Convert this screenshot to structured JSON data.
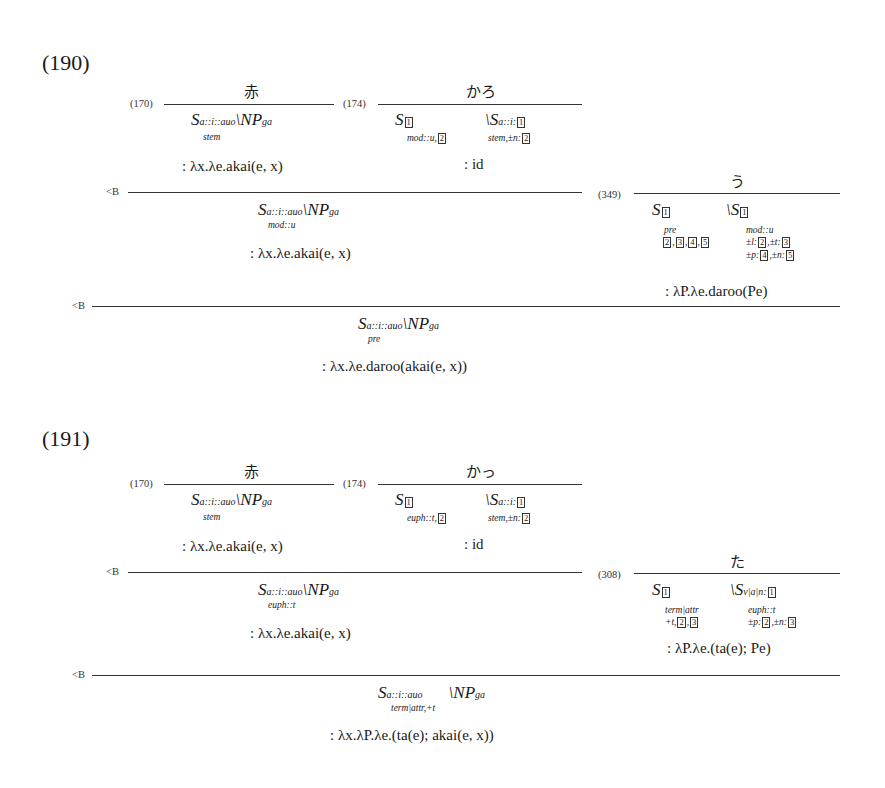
{
  "examples": [
    {
      "number": "(190)",
      "lexical": [
        {
          "rule": "(170)",
          "word": "赤",
          "category": "S_{a::i::auo, stem} \\ NP_{ga}",
          "cat_main": "S",
          "cat_sub": "a::i::auo",
          "cat_feat": "stem",
          "cat_arg": "\\NP",
          "cat_arg_sub": "ga",
          "sem": ": λx.λe.akai(e, x)"
        },
        {
          "rule": "(174)",
          "word": "かろ",
          "cat_left": "S",
          "cat_left_box": "1",
          "cat_left_feat": "mod::u,",
          "cat_left_feat_box": "2",
          "cat_right": "\\S",
          "cat_right_sub": "a::i:",
          "cat_right_box": "1",
          "cat_right_feat": "stem,±n:",
          "cat_right_feat_box": "2",
          "sem": ": id"
        },
        {
          "rule": "(349)",
          "word": "う",
          "cat_left": "S",
          "cat_left_box": "1",
          "cat_left_feat1": "pre",
          "cat_left_feat2_boxes": [
            "2",
            "3",
            "4",
            "5"
          ],
          "cat_right": "\\S",
          "cat_right_box": "1",
          "cat_right_feat1": "mod::u",
          "cat_right_feat2": "±l:",
          "cat_right_feat2_box": "2",
          "cat_right_feat2b": ",±t:",
          "cat_right_feat2b_box": "3",
          "cat_right_feat3": "±p:",
          "cat_right_feat3_box": "4",
          "cat_right_feat3b": ",±n:",
          "cat_right_feat3b_box": "5",
          "sem": ": λP.λe.daroo(Pe)"
        }
      ],
      "steps": [
        {
          "rule": "<B",
          "cat_main": "S",
          "cat_sub": "a::i::auo",
          "cat_feat": "mod::u",
          "cat_arg": "\\NP",
          "cat_arg_sub": "ga",
          "sem": ": λx.λe.akai(e, x)"
        },
        {
          "rule": "<B",
          "cat_main": "S",
          "cat_sub": "a::i::auo",
          "cat_feat": "pre",
          "cat_arg": "\\NP",
          "cat_arg_sub": "ga",
          "sem": ": λx.λe.daroo(akai(e, x))"
        }
      ]
    },
    {
      "number": "(191)",
      "lexical": [
        {
          "rule": "(170)",
          "word": "赤",
          "cat_main": "S",
          "cat_sub": "a::i::auo",
          "cat_feat": "stem",
          "cat_arg": "\\NP",
          "cat_arg_sub": "ga",
          "sem": ": λx.λe.akai(e, x)"
        },
        {
          "rule": "(174)",
          "word": "かっ",
          "cat_left": "S",
          "cat_left_box": "1",
          "cat_left_feat": "euph::t,",
          "cat_left_feat_box": "2",
          "cat_right": "\\S",
          "cat_right_sub": "a::i:",
          "cat_right_box": "1",
          "cat_right_feat": "stem,±n:",
          "cat_right_feat_box": "2",
          "sem": ": id"
        },
        {
          "rule": "(308)",
          "word": "た",
          "cat_left": "S",
          "cat_left_box": "1",
          "cat_left_feat1": "term|attr",
          "cat_left_feat2": "+t,",
          "cat_left_feat2_boxes": [
            "2",
            "3"
          ],
          "cat_right": "\\S",
          "cat_right_sub": "v|a|n:",
          "cat_right_box": "1",
          "cat_right_feat1": "euph::t",
          "cat_right_feat2": "±p:",
          "cat_right_feat2_box": "2",
          "cat_right_feat2b": ",±n:",
          "cat_right_feat2b_box": "3",
          "sem": ": λP.λe.(ta(e); Pe)"
        }
      ],
      "steps": [
        {
          "rule": "<B",
          "cat_main": "S",
          "cat_sub": "a::i::auo",
          "cat_feat": "euph::t",
          "cat_arg": "\\NP",
          "cat_arg_sub": "ga",
          "sem": ": λx.λe.akai(e, x)"
        },
        {
          "rule": "<B",
          "cat_main": "S",
          "cat_sub": "a::i::auo",
          "cat_feat": "term|attr,+t",
          "cat_arg": "\\NP",
          "cat_arg_sub": "ga",
          "sem": ": λx.λP.λe.(ta(e); akai(e, x))"
        }
      ]
    }
  ]
}
